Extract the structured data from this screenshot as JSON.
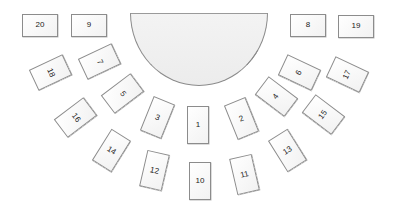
{
  "diagram": {
    "type": "seating-layout",
    "stage": {
      "shape": "semicircle",
      "fill": "#efefef",
      "stroke": "#8a8a8a"
    },
    "seats": [
      {
        "label": "20",
        "cx": 40,
        "cy": 25,
        "w": 36,
        "h": 23,
        "rot": 0,
        "text_rot": 0
      },
      {
        "label": "9",
        "cx": 89,
        "cy": 25,
        "w": 36,
        "h": 23,
        "rot": 0,
        "text_rot": 0
      },
      {
        "label": "8",
        "cx": 308,
        "cy": 25,
        "w": 36,
        "h": 23,
        "rot": 0,
        "text_rot": 0
      },
      {
        "label": "19",
        "cx": 356,
        "cy": 26,
        "w": 36,
        "h": 23,
        "rot": 0,
        "text_rot": 0
      },
      {
        "label": "18",
        "cx": 50,
        "cy": 72,
        "w": 37,
        "h": 23,
        "rot": -25,
        "text_rot": 90
      },
      {
        "label": "7",
        "cx": 99,
        "cy": 61,
        "w": 37,
        "h": 23,
        "rot": -25,
        "text_rot": 90
      },
      {
        "label": "16",
        "cx": 75,
        "cy": 117,
        "w": 37,
        "h": 23,
        "rot": -37,
        "text_rot": 90
      },
      {
        "label": "5",
        "cx": 122,
        "cy": 93,
        "w": 37,
        "h": 23,
        "rot": -37,
        "text_rot": 90
      },
      {
        "label": "3",
        "cx": 157,
        "cy": 117,
        "w": 23,
        "h": 37,
        "rot": 22,
        "text_rot": 0
      },
      {
        "label": "14",
        "cx": 111,
        "cy": 150,
        "w": 23,
        "h": 37,
        "rot": 32,
        "text_rot": 0
      },
      {
        "label": "12",
        "cx": 154,
        "cy": 170,
        "w": 23,
        "h": 37,
        "rot": 13,
        "text_rot": 0
      },
      {
        "label": "1",
        "cx": 198,
        "cy": 125,
        "w": 22,
        "h": 38,
        "rot": 0,
        "text_rot": 0
      },
      {
        "label": "10",
        "cx": 200,
        "cy": 181,
        "w": 22,
        "h": 38,
        "rot": 0,
        "text_rot": 0
      },
      {
        "label": "2",
        "cx": 241,
        "cy": 118,
        "w": 23,
        "h": 37,
        "rot": -22,
        "text_rot": 0
      },
      {
        "label": "11",
        "cx": 244,
        "cy": 174,
        "w": 23,
        "h": 37,
        "rot": -13,
        "text_rot": 0
      },
      {
        "label": "13",
        "cx": 287,
        "cy": 150,
        "w": 23,
        "h": 37,
        "rot": -32,
        "text_rot": 0
      },
      {
        "label": "4",
        "cx": 276,
        "cy": 96,
        "w": 37,
        "h": 23,
        "rot": 37,
        "text_rot": -90
      },
      {
        "label": "6",
        "cx": 299,
        "cy": 72,
        "w": 37,
        "h": 23,
        "rot": 25,
        "text_rot": -90
      },
      {
        "label": "15",
        "cx": 323,
        "cy": 114,
        "w": 37,
        "h": 23,
        "rot": 37,
        "text_rot": -90
      },
      {
        "label": "17",
        "cx": 347,
        "cy": 74,
        "w": 37,
        "h": 23,
        "rot": 25,
        "text_rot": -90
      }
    ]
  }
}
